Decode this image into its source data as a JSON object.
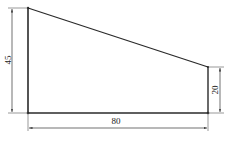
{
  "diagram": {
    "type": "technical-drawing",
    "shape": "right trapezoid",
    "colors": {
      "outline": "#2a2a2a",
      "dimension_line": "#333333",
      "text": "#222222",
      "background": "#ffffff"
    },
    "dimensions": {
      "left_height": {
        "label": "45",
        "value": 45,
        "orientation": "vertical",
        "side": "left"
      },
      "right_height": {
        "label": "20",
        "value": 20,
        "orientation": "vertical",
        "side": "right"
      },
      "bottom_width": {
        "label": "80",
        "value": 80,
        "orientation": "horizontal",
        "side": "bottom"
      }
    }
  }
}
